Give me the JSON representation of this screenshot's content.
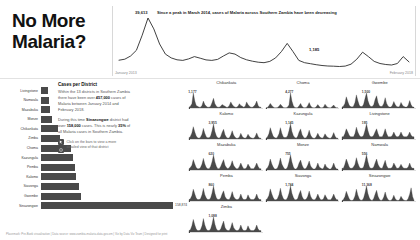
{
  "title": "No More\nMalaria?",
  "top_chart": {
    "peak_label": "39,613",
    "headline": "Since a peak in March 2014, cases of Malaria across Southern Zambia have been decreasing",
    "low_label": "1,185",
    "axis_left": "January 2013",
    "axis_right": "February 2018"
  },
  "panel": {
    "heading": "Cases per District",
    "para1_a": "Within the 13 districts in Southern Zambia there have been over ",
    "para1_b": "457,000",
    "para1_c": " cases of Malaria between January 2014 and February 2018.",
    "para2_a": "During this time ",
    "para2_b": "Sinazongwe",
    "para2_c": " district had over ",
    "para2_d": "158,000",
    "para2_e": " cases. This is nearly ",
    "para2_f": "35%",
    "para2_g": " of all Malaria cases in Southern Zambia.",
    "hint_line1": "Click on the bars to view a more",
    "hint_line2": "detailed view of that district"
  },
  "footer": "Placemark: Pre-Bank visualisation | Data source: www.zambia-malaria-data.gov.zm | Viz by Data Viz Team | Designed for print",
  "chart_data": [
    {
      "type": "line",
      "title": "Cases of Malaria across Southern Zambia",
      "xlabel": "",
      "ylabel": "Cases",
      "x": [
        "January 2013",
        "February 2018"
      ],
      "annotations": [
        {
          "label": "39,613",
          "note": "peak March 2014"
        },
        {
          "label": "1,185",
          "note": "low point"
        }
      ],
      "values": [
        6200,
        7000,
        9500,
        14000,
        26000,
        39613,
        31000,
        19000,
        11000,
        8000,
        6500,
        6000,
        7200,
        9000,
        7800,
        6400,
        6000,
        6800,
        9500,
        12000,
        11000,
        8200,
        6500,
        5400,
        4600,
        4200,
        5200,
        8000,
        13000,
        19500,
        13000,
        6000,
        4200,
        3400,
        2600,
        2000,
        1600,
        1400,
        1185,
        1500,
        3000,
        7000,
        12500,
        9000,
        5200,
        3600,
        2800,
        2400,
        3600,
        9000,
        4800
      ]
    },
    {
      "type": "bar",
      "title": "Cases per District",
      "orientation": "horizontal",
      "xlabel": "Cases",
      "ylabel": "District",
      "categories": [
        "Livingstone",
        "Namwala",
        "Mazabuka",
        "Monze",
        "Chikankata",
        "Zimba",
        "Choma",
        "Kazungula",
        "Pemba",
        "Kalomo",
        "Siavonga",
        "Gwembe",
        "Sinazongwe"
      ],
      "values": [
        8200,
        9400,
        10200,
        12600,
        20400,
        22800,
        36000,
        38500,
        41000,
        42500,
        46000,
        48500,
        158874
      ],
      "value_labels": [
        "",
        "",
        "",
        "",
        "",
        "",
        "",
        "",
        "",
        "",
        "",
        "",
        "158,874"
      ],
      "xlim": [
        0,
        158874
      ]
    },
    {
      "type": "line",
      "title": "District small multiples",
      "panels": [
        {
          "name": "Chikankata",
          "peak_label": "1,177",
          "values": [
            2,
            3,
            6,
            18,
            9,
            4,
            3,
            2,
            2,
            4,
            9,
            5,
            3,
            2,
            2,
            3,
            7,
            12,
            6,
            3,
            2,
            2,
            3,
            5,
            4,
            3,
            2,
            2,
            4,
            8,
            5,
            3,
            2,
            2,
            3,
            6,
            4,
            3,
            2,
            3,
            8,
            5,
            3,
            2,
            2,
            3,
            5,
            9,
            4,
            2,
            2
          ]
        },
        {
          "name": "Choma",
          "peak_label": "4,277",
          "values": [
            3,
            4,
            8,
            14,
            9,
            5,
            3,
            3,
            4,
            7,
            12,
            8,
            4,
            3,
            3,
            5,
            10,
            40,
            20,
            8,
            4,
            3,
            4,
            8,
            14,
            7,
            4,
            3,
            4,
            9,
            16,
            8,
            4,
            3,
            3,
            6,
            11,
            6,
            3,
            3,
            5,
            12,
            7,
            4,
            3,
            3,
            6,
            10,
            5,
            3,
            3
          ]
        },
        {
          "name": "Gwembe",
          "peak_label": "1,500",
          "values": [
            4,
            6,
            12,
            26,
            16,
            8,
            5,
            4,
            6,
            14,
            30,
            18,
            8,
            5,
            5,
            10,
            22,
            34,
            18,
            9,
            5,
            5,
            9,
            20,
            28,
            14,
            7,
            5,
            6,
            12,
            24,
            12,
            6,
            4,
            4,
            8,
            16,
            9,
            5,
            4,
            6,
            14,
            8,
            5,
            4,
            4,
            8,
            18,
            9,
            4,
            4
          ]
        },
        {
          "name": "Kalomo",
          "peak_label": "3,955",
          "values": [
            5,
            8,
            16,
            30,
            18,
            9,
            5,
            4,
            6,
            13,
            26,
            15,
            7,
            5,
            5,
            9,
            20,
            36,
            19,
            9,
            5,
            4,
            8,
            17,
            24,
            12,
            6,
            4,
            5,
            11,
            21,
            11,
            6,
            4,
            4,
            7,
            15,
            8,
            5,
            4,
            6,
            13,
            8,
            5,
            4,
            4,
            8,
            16,
            8,
            4,
            4
          ]
        },
        {
          "name": "Kazungula",
          "peak_label": "1,145",
          "values": [
            3,
            5,
            10,
            20,
            12,
            6,
            4,
            3,
            5,
            10,
            20,
            11,
            5,
            4,
            4,
            7,
            15,
            26,
            14,
            7,
            4,
            3,
            6,
            13,
            18,
            9,
            5,
            3,
            4,
            8,
            16,
            8,
            4,
            3,
            3,
            6,
            11,
            6,
            4,
            3,
            5,
            10,
            6,
            4,
            3,
            3,
            6,
            12,
            6,
            3,
            3
          ]
        },
        {
          "name": "Livingstone",
          "peak_label": "195",
          "values": [
            2,
            2,
            4,
            7,
            5,
            3,
            2,
            2,
            2,
            4,
            8,
            5,
            3,
            2,
            2,
            3,
            6,
            10,
            6,
            3,
            2,
            2,
            3,
            5,
            7,
            4,
            2,
            2,
            2,
            4,
            7,
            4,
            2,
            2,
            2,
            3,
            5,
            3,
            2,
            2,
            3,
            5,
            3,
            2,
            2,
            2,
            3,
            5,
            3,
            2,
            2
          ]
        },
        {
          "name": "Mazabuka",
          "peak_label": "620",
          "values": [
            2,
            3,
            5,
            10,
            6,
            3,
            2,
            2,
            3,
            6,
            11,
            6,
            3,
            2,
            2,
            4,
            8,
            14,
            8,
            4,
            2,
            2,
            4,
            7,
            10,
            5,
            3,
            2,
            3,
            5,
            9,
            5,
            3,
            2,
            2,
            4,
            7,
            4,
            2,
            2,
            3,
            6,
            4,
            2,
            2,
            2,
            4,
            7,
            4,
            2,
            2
          ]
        },
        {
          "name": "Monze",
          "peak_label": "755",
          "values": [
            2,
            3,
            6,
            12,
            7,
            4,
            2,
            2,
            3,
            7,
            13,
            7,
            4,
            2,
            2,
            4,
            9,
            16,
            9,
            4,
            2,
            2,
            4,
            8,
            11,
            6,
            3,
            2,
            3,
            6,
            10,
            5,
            3,
            2,
            2,
            4,
            8,
            4,
            3,
            2,
            3,
            7,
            4,
            3,
            2,
            2,
            4,
            8,
            4,
            2,
            2
          ]
        },
        {
          "name": "Namwala",
          "peak_label": "556",
          "values": [
            2,
            2,
            5,
            9,
            6,
            3,
            2,
            2,
            3,
            5,
            10,
            6,
            3,
            2,
            2,
            3,
            7,
            12,
            7,
            3,
            2,
            2,
            3,
            6,
            9,
            5,
            3,
            2,
            2,
            5,
            8,
            4,
            2,
            2,
            2,
            3,
            6,
            4,
            2,
            2,
            3,
            5,
            3,
            2,
            2,
            2,
            3,
            6,
            3,
            2,
            2
          ]
        },
        {
          "name": "Pemba",
          "peak_label": "860",
          "values": [
            3,
            4,
            8,
            16,
            10,
            5,
            3,
            3,
            4,
            9,
            17,
            9,
            5,
            3,
            3,
            5,
            11,
            20,
            11,
            5,
            3,
            3,
            5,
            10,
            14,
            7,
            4,
            3,
            3,
            7,
            13,
            7,
            4,
            3,
            3,
            5,
            10,
            5,
            3,
            3,
            4,
            9,
            5,
            3,
            3,
            3,
            5,
            10,
            5,
            3,
            3
          ]
        },
        {
          "name": "Siavonga",
          "peak_label": "1,744",
          "values": [
            3,
            5,
            9,
            18,
            11,
            6,
            3,
            3,
            5,
            10,
            19,
            10,
            5,
            3,
            3,
            6,
            12,
            22,
            12,
            6,
            3,
            3,
            5,
            11,
            16,
            8,
            4,
            3,
            4,
            8,
            15,
            8,
            4,
            3,
            3,
            6,
            11,
            6,
            3,
            3,
            5,
            10,
            6,
            3,
            3,
            3,
            6,
            11,
            6,
            3,
            3
          ]
        },
        {
          "name": "Sinazongwe",
          "peak_label": "11,368",
          "values": [
            8,
            14,
            30,
            60,
            38,
            18,
            10,
            8,
            14,
            34,
            72,
            40,
            18,
            10,
            10,
            22,
            50,
            90,
            48,
            22,
            11,
            9,
            20,
            44,
            66,
            32,
            15,
            9,
            12,
            28,
            56,
            28,
            13,
            8,
            9,
            18,
            38,
            18,
            10,
            8,
            14,
            32,
            18,
            10,
            8,
            9,
            20,
            44,
            80,
            30,
            10
          ]
        },
        {
          "name": "Zimba",
          "peak_label": "1,088",
          "values": [
            3,
            4,
            9,
            17,
            10,
            5,
            3,
            3,
            4,
            9,
            18,
            10,
            5,
            3,
            3,
            5,
            11,
            20,
            11,
            5,
            3,
            3,
            5,
            10,
            15,
            7,
            4,
            3,
            3,
            7,
            13,
            7,
            4,
            3,
            3,
            5,
            10,
            5,
            3,
            3,
            4,
            9,
            5,
            3,
            3,
            3,
            5,
            10,
            5,
            3,
            3
          ]
        }
      ]
    }
  ]
}
